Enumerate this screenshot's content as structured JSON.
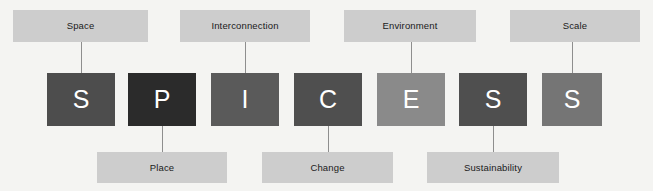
{
  "diagram": {
    "background_color": "#f4f4f2",
    "chip_color": "#cdcdcd",
    "letter_text_color": "#ffffff",
    "connector_color": "#8e8e8e",
    "acronym": "SPICESS"
  },
  "tiles": [
    {
      "letter": "S",
      "concept": "Space",
      "color": "#4d4d4d",
      "x": 47,
      "y": 73,
      "w": 68,
      "h": 53
    },
    {
      "letter": "P",
      "concept": "Place",
      "color": "#2b2b2b",
      "x": 128,
      "y": 73,
      "w": 68,
      "h": 53
    },
    {
      "letter": "I",
      "concept": "Interconnection",
      "color": "#5a5a5a",
      "x": 211,
      "y": 73,
      "w": 68,
      "h": 53
    },
    {
      "letter": "C",
      "concept": "Change",
      "color": "#4f4f4f",
      "x": 294,
      "y": 73,
      "w": 68,
      "h": 53
    },
    {
      "letter": "E",
      "concept": "Environment",
      "color": "#8a8a8a",
      "x": 377,
      "y": 73,
      "w": 68,
      "h": 53
    },
    {
      "letter": "S",
      "concept": "Sustainability",
      "color": "#4f4f4f",
      "x": 459,
      "y": 73,
      "w": 68,
      "h": 53
    },
    {
      "letter": "S",
      "concept": "Scale",
      "color": "#757575",
      "x": 542,
      "y": 73,
      "w": 60,
      "h": 53
    }
  ],
  "labels_top": [
    {
      "text": "Space",
      "x": 13,
      "y": 10,
      "w": 135,
      "h": 32,
      "line_x": 81,
      "line_y": 42,
      "line_h": 31
    },
    {
      "text": "Interconnection",
      "x": 180,
      "y": 10,
      "w": 130,
      "h": 32,
      "line_x": 245,
      "line_y": 42,
      "line_h": 31
    },
    {
      "text": "Environment",
      "x": 344,
      "y": 10,
      "w": 132,
      "h": 32,
      "line_x": 411,
      "line_y": 42,
      "line_h": 31
    },
    {
      "text": "Scale",
      "x": 510,
      "y": 10,
      "w": 130,
      "h": 32,
      "line_x": 572,
      "line_y": 42,
      "line_h": 31
    }
  ],
  "labels_bottom": [
    {
      "text": "Place",
      "x": 97,
      "y": 152,
      "w": 130,
      "h": 31,
      "line_x": 162,
      "line_y": 126,
      "line_h": 26
    },
    {
      "text": "Change",
      "x": 262,
      "y": 152,
      "w": 131,
      "h": 31,
      "line_x": 328,
      "line_y": 126,
      "line_h": 26
    },
    {
      "text": "Sustainability",
      "x": 427,
      "y": 152,
      "w": 132,
      "h": 31,
      "line_x": 493,
      "line_y": 126,
      "line_h": 26
    }
  ]
}
